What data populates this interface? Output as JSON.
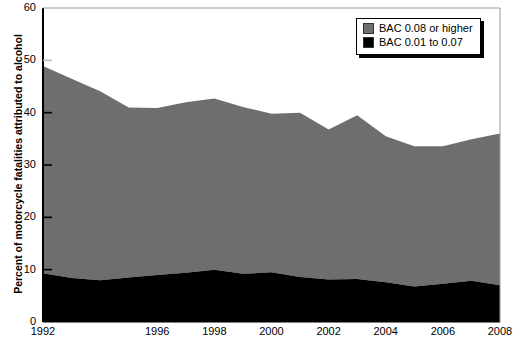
{
  "chart_data": {
    "type": "area",
    "title": "",
    "subtitle": "",
    "stacked": true,
    "xlabel": "",
    "ylabel": "Percent of motorcycle fatalities attributed to alcohol",
    "xlim": [
      1992,
      2008
    ],
    "ylim": [
      0,
      60
    ],
    "ytick_step": 10,
    "grid": false,
    "legend_position": "top-right",
    "x": [
      1992,
      1993,
      1994,
      1995,
      1996,
      1997,
      1998,
      1999,
      2000,
      2001,
      2002,
      2003,
      2004,
      2005,
      2006,
      2007,
      2008
    ],
    "xticks": [
      1992,
      1996,
      1998,
      2000,
      2002,
      2004,
      2006,
      2008
    ],
    "xtick_labels": [
      "1992",
      "1996",
      "1998",
      "2000",
      "2002",
      "2004",
      "2006",
      "2008"
    ],
    "yticks": [
      0,
      10,
      20,
      30,
      40,
      50,
      60
    ],
    "ytick_labels": [
      "0",
      "10",
      "20",
      "30",
      "40",
      "50",
      "60"
    ],
    "series": [
      {
        "name": "BAC 0.01 to 0.07",
        "color": "#000000",
        "values": [
          9.3,
          8.4,
          8.0,
          8.5,
          9.0,
          9.4,
          10.0,
          9.2,
          9.5,
          8.6,
          8.1,
          8.2,
          7.6,
          6.8,
          7.3,
          7.9,
          7.0
        ]
      },
      {
        "name": "BAC 0.08 or higher",
        "color": "#6e6e6e",
        "values": [
          39.6,
          38.1,
          36.1,
          32.5,
          31.9,
          32.6,
          32.7,
          31.9,
          30.3,
          31.4,
          28.7,
          31.3,
          27.9,
          26.8,
          26.3,
          27.0,
          29.0
        ]
      }
    ],
    "series_totals": [
      {
        "name": "Total (stacked top)",
        "values": [
          48.9,
          46.5,
          44.1,
          41.0,
          40.9,
          42.0,
          42.7,
          41.1,
          39.8,
          40.0,
          36.8,
          39.5,
          35.5,
          33.6,
          33.6,
          34.9,
          36.0
        ]
      }
    ],
    "annotations": []
  },
  "legend": {
    "items": [
      {
        "label": "BAC 0.08 or higher",
        "swatch": "#6e6e6e"
      },
      {
        "label": "BAC 0.01 to 0.07",
        "swatch": "#000000"
      }
    ]
  },
  "colors": {
    "gray_band": "#6e6e6e",
    "black_band": "#000000",
    "axis": "#000000",
    "background": "#ffffff"
  }
}
